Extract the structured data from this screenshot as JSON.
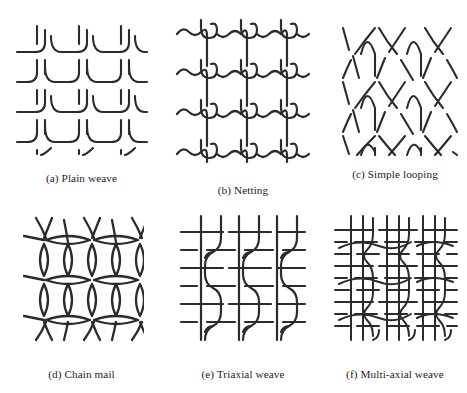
{
  "figure": {
    "background_color": "#ffffff",
    "stroke_color": "#2b2b2b",
    "panels": [
      {
        "id": "a",
        "label": "(a) Plain weave",
        "diagram_name": "plain-weave-diagram",
        "description": "Orthogonal warp and weft yarns interlacing one-over-one-under in a square grid"
      },
      {
        "id": "b",
        "label": "(b) Netting",
        "diagram_name": "netting-diagram",
        "description": "Vertical cords joined to horizontal cords by sheet-bend style knots at each node"
      },
      {
        "id": "c",
        "label": "(c) Simple looping",
        "diagram_name": "simple-looping-diagram",
        "description": "Single element forming rows of interconnected loops, each loop drawn through the loop of the row above"
      },
      {
        "id": "d",
        "label": "(d) Chain mail",
        "diagram_name": "chain-mail-diagram",
        "description": "Interlocking rings linked four-in-one forming a lattice of lens shaped links"
      },
      {
        "id": "e",
        "label": "(e) Triaxial weave",
        "diagram_name": "triaxial-weave-diagram",
        "description": "Three yarn sets interlacing at sixty degree angles giving an open hexagonal mesh"
      },
      {
        "id": "f",
        "label": "(f) Multi-axial weave",
        "diagram_name": "multi-axial-weave-diagram",
        "description": "Dense structure with several yarn directions stacked and interlaced together"
      }
    ]
  }
}
